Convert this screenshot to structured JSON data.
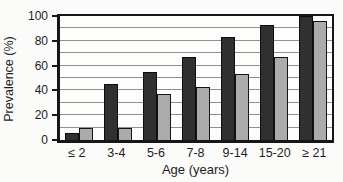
{
  "figure": {
    "background": "#fbfbf9"
  },
  "chart_data": {
    "type": "bar",
    "title": "",
    "xlabel": "Age (years)",
    "ylabel": "Prevalence (%)",
    "categories": [
      "≤ 2",
      "3-4",
      "5-6",
      "7-8",
      "9-14",
      "15-20",
      "≥ 21"
    ],
    "series": [
      {
        "name": "series-dark",
        "color": "#302f31",
        "border_color": "#0c0c0c",
        "values": [
          6,
          45,
          55,
          67,
          83,
          93,
          100
        ]
      },
      {
        "name": "series-light",
        "color": "#ababab",
        "border_color": "#141414",
        "values": [
          10,
          10,
          37,
          43,
          53,
          67,
          96
        ]
      }
    ],
    "ylim": [
      0,
      100
    ],
    "yticks": [
      0,
      20,
      40,
      60,
      80,
      100
    ],
    "grid": {
      "show": true,
      "interval": 10,
      "color": "#8f8f8f"
    },
    "axis_color": "#161616",
    "legend": {
      "show": false
    }
  }
}
